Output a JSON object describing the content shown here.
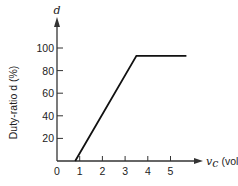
{
  "chart_data": {
    "type": "line",
    "title": "",
    "xlabel": "v_c (volts)",
    "xlabel_var": "v",
    "xlabel_sub": "c",
    "xlabel_unit": "(volts)",
    "ylabel": "Duty-ratio d (%)",
    "y_axis_symbol": "d",
    "xlim": [
      0,
      6
    ],
    "ylim": [
      0,
      110
    ],
    "xticks": [
      0,
      1,
      2,
      3,
      4,
      5
    ],
    "yticks": [
      20,
      40,
      60,
      80,
      100
    ],
    "grid": false,
    "legend": null,
    "series": [
      {
        "name": "d vs v_c",
        "x": [
          0.8,
          3.5,
          5.7
        ],
        "y": [
          0,
          93,
          93
        ]
      }
    ]
  },
  "layout": {
    "origin_px": [
      57,
      161
    ],
    "px_per_x": 22.7,
    "px_per_y": 1.13,
    "line_color": "#111111",
    "axis_color": "#333333"
  }
}
